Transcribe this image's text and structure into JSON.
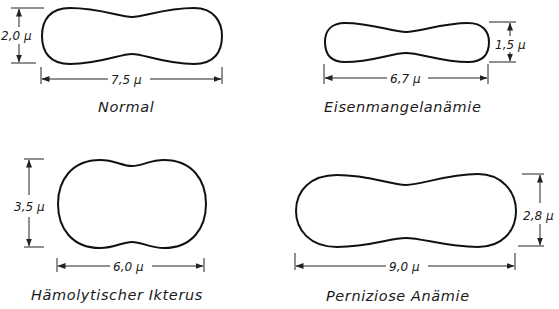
{
  "figure": {
    "title": "",
    "colors": {
      "stroke": "#111111",
      "background": "#ffffff"
    },
    "panels": [
      {
        "name": "Normal",
        "width_label": "7,5 μ",
        "height_label": "2,0 μ",
        "width_um": 7.5,
        "height_um": 2.0
      },
      {
        "name": "Eisenmangelanämie",
        "width_label": "6,7 μ",
        "height_label": "1,5 μ",
        "width_um": 6.7,
        "height_um": 1.5
      },
      {
        "name": "Hämolytischer Ikterus",
        "width_label": "6,0 μ",
        "height_label": "3,5 μ",
        "width_um": 6.0,
        "height_um": 3.5
      },
      {
        "name": "Perniziose Anämie",
        "width_label": "9,0 μ",
        "height_label": "2,8 μ",
        "width_um": 9.0,
        "height_um": 2.8
      }
    ]
  }
}
